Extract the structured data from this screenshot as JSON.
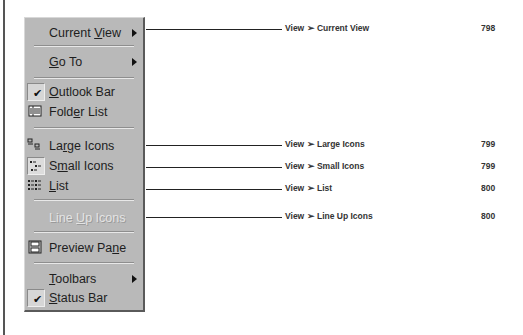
{
  "menu": {
    "items": [
      {
        "id": "current-view",
        "label_pre": "Current ",
        "label_ul": "V",
        "label_post": "iew",
        "submenu": true
      },
      {
        "id": "go-to",
        "label_pre": "",
        "label_ul": "G",
        "label_post": "o To",
        "submenu": true
      },
      {
        "id": "outlook-bar",
        "label_pre": "",
        "label_ul": "O",
        "label_post": "utlook Bar",
        "checked": true,
        "icon": "check-icon"
      },
      {
        "id": "folder-list",
        "label_pre": "Fold",
        "label_ul": "e",
        "label_post": "r List",
        "icon": "folder-list-icon"
      },
      {
        "id": "large-icons",
        "label_pre": "La",
        "label_ul": "r",
        "label_post": "ge Icons",
        "icon": "large-icons-icon"
      },
      {
        "id": "small-icons",
        "label_pre": "S",
        "label_ul": "m",
        "label_post": "all Icons",
        "icon": "small-icons-icon",
        "pressed": true
      },
      {
        "id": "list",
        "label_pre": "",
        "label_ul": "L",
        "label_post": "ist",
        "icon": "list-icon"
      },
      {
        "id": "line-up-icons",
        "label_pre": "Line ",
        "label_ul": "U",
        "label_post": "p Icons",
        "disabled": true
      },
      {
        "id": "preview-pane",
        "label_pre": "Preview Pa",
        "label_ul": "n",
        "label_post": "e",
        "icon": "preview-pane-icon"
      },
      {
        "id": "toolbars",
        "label_pre": "",
        "label_ul": "T",
        "label_post": "oolbars",
        "submenu": true
      },
      {
        "id": "status-bar",
        "label_pre": "",
        "label_ul": "S",
        "label_post": "tatus Bar",
        "checked": true,
        "icon": "check-icon"
      }
    ]
  },
  "callouts": [
    {
      "label": "View ➢ Current View",
      "page": "798"
    },
    {
      "label": "View ➢ Large Icons",
      "page": "799"
    },
    {
      "label": "View ➢ Small Icons",
      "page": "799"
    },
    {
      "label": "View ➢ List",
      "page": "800"
    },
    {
      "label": "View ➢ Line Up Icons",
      "page": "800"
    }
  ],
  "colors": {
    "menu_bg": "#b9b9b9",
    "text": "#1e1e1e",
    "disabled_text": "#e4e4e4",
    "callout_text": "#333333"
  }
}
